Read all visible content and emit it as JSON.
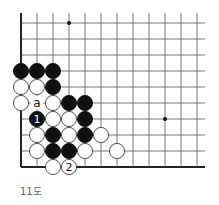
{
  "diagram": {
    "type": "go-board-fragment",
    "caption": "11도",
    "grid": {
      "x0": 21,
      "y0": 23,
      "step": 16,
      "cols": 12,
      "rows": 10,
      "left_edge": true,
      "bottom_edge": true,
      "top_open": true,
      "right_open": true,
      "line_color": "#555555",
      "edge_color": "#222222"
    },
    "star_points": [
      {
        "col": 3,
        "row": 0
      },
      {
        "col": 9,
        "row": 6
      }
    ],
    "stones": [
      {
        "color": "black",
        "col": 0,
        "row": 3
      },
      {
        "color": "black",
        "col": 1,
        "row": 3
      },
      {
        "color": "black",
        "col": 2,
        "row": 3
      },
      {
        "color": "white",
        "col": 0,
        "row": 4
      },
      {
        "color": "white",
        "col": 1,
        "row": 4
      },
      {
        "color": "black",
        "col": 2,
        "row": 4
      },
      {
        "color": "white",
        "col": 0,
        "row": 5
      },
      {
        "color": "white",
        "col": 2,
        "row": 5
      },
      {
        "color": "black",
        "col": 3,
        "row": 5
      },
      {
        "color": "black",
        "col": 4,
        "row": 5
      },
      {
        "color": "black",
        "col": 1,
        "row": 6,
        "label": "1"
      },
      {
        "color": "white",
        "col": 2,
        "row": 6
      },
      {
        "color": "white",
        "col": 3,
        "row": 6
      },
      {
        "color": "black",
        "col": 4,
        "row": 6
      },
      {
        "color": "white",
        "col": 1,
        "row": 7
      },
      {
        "color": "black",
        "col": 2,
        "row": 7
      },
      {
        "color": "white",
        "col": 3,
        "row": 7
      },
      {
        "color": "black",
        "col": 4,
        "row": 7
      },
      {
        "color": "white",
        "col": 5,
        "row": 7
      },
      {
        "color": "white",
        "col": 1,
        "row": 8
      },
      {
        "color": "black",
        "col": 2,
        "row": 8
      },
      {
        "color": "black",
        "col": 3,
        "row": 8
      },
      {
        "color": "white",
        "col": 4,
        "row": 8
      },
      {
        "color": "white",
        "col": 6,
        "row": 8
      },
      {
        "color": "white",
        "col": 2,
        "row": 9
      },
      {
        "color": "white",
        "col": 3,
        "row": 9,
        "label": "2"
      }
    ],
    "marks": [
      {
        "col": 1,
        "row": 5,
        "label": "a"
      }
    ]
  }
}
